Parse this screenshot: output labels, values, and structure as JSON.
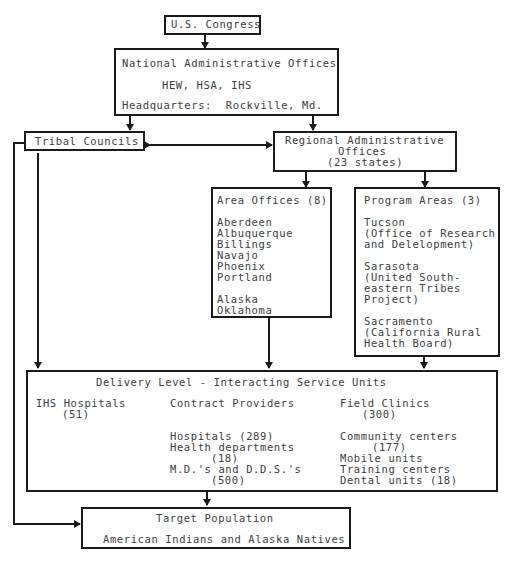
{
  "congress": {
    "label": "U.S. Congress"
  },
  "national": {
    "title": "National Administrative Offices",
    "agencies": "HEW, HSA, IHS",
    "headquarters": "Headquarters:  Rockville, Md."
  },
  "tribal": {
    "label": "Tribal Councils"
  },
  "regional": {
    "line1": "Regional Administrative",
    "line2": "Offices",
    "line3": "(23 states)"
  },
  "area_offices": {
    "title": "Area Offices (8)",
    "items": [
      "Aberdeen",
      "Albuquerque",
      "Billings",
      "Navajo",
      "Phoenix",
      "Portland"
    ],
    "items2": [
      "Alaska",
      "Oklahoma"
    ]
  },
  "program_areas": {
    "title": "Program Areas (3)",
    "programs": [
      {
        "name": "Tucson",
        "desc1": "(Office of Research",
        "desc2": "and Delelopment)"
      },
      {
        "name": "Sarasota",
        "desc1": "(United South-",
        "desc2": "eastern Tribes",
        "desc3": "Project)"
      },
      {
        "name": "Sacramento",
        "desc1": "(California Rural",
        "desc2": "Health Board)"
      }
    ]
  },
  "delivery": {
    "title": "Delivery Level - Interacting Service Units",
    "ihs": {
      "label": "IHS Hospitals",
      "count": "(51)"
    },
    "contract": {
      "label": "Contract Providers",
      "hospitals": "Hospitals (289)",
      "health_dept": "Health departments",
      "health_dept_count": "(18)",
      "mds": "M.D.'s and D.D.S.'s",
      "mds_count": "(500)"
    },
    "field": {
      "label": "Field Clinics",
      "count": "(300)",
      "community": "Community centers",
      "community_count": "(177)",
      "mobile": "Mobile units",
      "training": "Training centers",
      "dental": "Dental units (18)"
    }
  },
  "target": {
    "title": "Target Population",
    "subtitle": "American Indians and Alaska Natives"
  }
}
